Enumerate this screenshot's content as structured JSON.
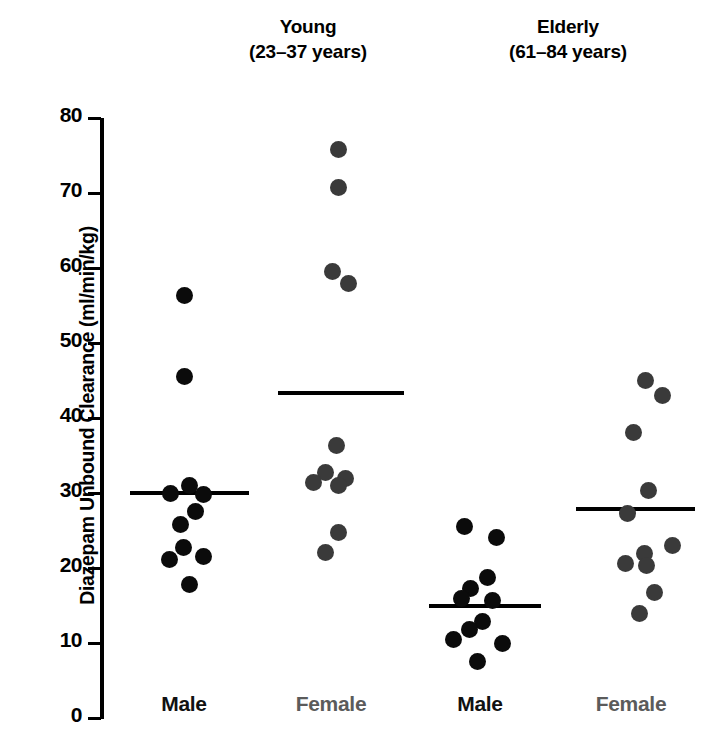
{
  "figure": {
    "width": 713,
    "height": 742,
    "background": "#ffffff"
  },
  "headers": [
    {
      "name": "Young",
      "range": "(23–37 years)"
    },
    {
      "name": "Elderly",
      "range": "(61–84 years)"
    }
  ],
  "axis": {
    "title": "Diazepam Unbound Clearance (ml/min/kg)",
    "ticks": [
      "80",
      "70",
      "60",
      "50",
      "40",
      "30",
      "20",
      "10",
      "0"
    ]
  },
  "x_labels": [
    {
      "text": "Male",
      "color": "#111111"
    },
    {
      "text": "Female",
      "color": "#5b5b5b"
    },
    {
      "text": "Male",
      "color": "#111111"
    },
    {
      "text": "Female",
      "color": "#5b5b5b"
    }
  ],
  "colors": {
    "male_dot": "#0b0b0b",
    "female_dot": "#3a3a3a",
    "axis": "#000000",
    "mean_line": "#000000",
    "background": "#ffffff"
  },
  "chart_data": {
    "type": "scatter",
    "xlabel": "",
    "ylabel": "Diazepam Unbound Clearance (ml/min/kg)",
    "ylim": [
      0,
      80
    ],
    "ytick_step": 10,
    "yticks": [
      0,
      10,
      20,
      30,
      40,
      50,
      60,
      70,
      80
    ],
    "grid": false,
    "legend": "none",
    "groups": [
      {
        "group": "Young",
        "age_range": "23-37 years",
        "sex": "Male",
        "color": "#0b0b0b",
        "mean": 30.0,
        "n": 12,
        "values": [
          56.4,
          45.6,
          31.0,
          30.2,
          29.8,
          27.8,
          26.1,
          24.4,
          23.0,
          21.5,
          20.6,
          17.8
        ]
      },
      {
        "group": "Young",
        "age_range": "23-37 years",
        "sex": "Female",
        "color": "#3a3a3a",
        "mean": 43.3,
        "n": 9,
        "values": [
          75.8,
          70.8,
          59.6,
          58.0,
          36.4,
          32.8,
          32.0,
          31.3,
          31.0,
          24.8,
          22.1
        ]
      },
      {
        "group": "Elderly",
        "age_range": "61-84 years",
        "sex": "Male",
        "color": "#0b0b0b",
        "mean": 15.0,
        "n": 11,
        "values": [
          25.5,
          24.1,
          18.8,
          17.3,
          16.4,
          15.8,
          13.0,
          11.9,
          11.0,
          9.9,
          7.6
        ]
      },
      {
        "group": "Elderly",
        "age_range": "61-84 years",
        "sex": "Female",
        "color": "#3a3a3a",
        "mean": 27.9,
        "n": 11,
        "values": [
          45.0,
          43.0,
          38.1,
          30.4,
          27.3,
          23.0,
          20.8,
          20.4,
          21.8,
          16.8,
          14.0
        ]
      }
    ],
    "points": [
      {
        "col": 0,
        "sex": "Male",
        "x": 184,
        "y": 56.4
      },
      {
        "col": 0,
        "sex": "Male",
        "x": 184,
        "y": 45.6
      },
      {
        "col": 0,
        "sex": "Male",
        "x": 189,
        "y": 31.0
      },
      {
        "col": 0,
        "sex": "Male",
        "x": 170,
        "y": 29.9
      },
      {
        "col": 0,
        "sex": "Male",
        "x": 203,
        "y": 29.8
      },
      {
        "col": 0,
        "sex": "Male",
        "x": 195,
        "y": 27.5
      },
      {
        "col": 0,
        "sex": "Male",
        "x": 180,
        "y": 25.8
      },
      {
        "col": 0,
        "sex": "Male",
        "x": 183,
        "y": 22.8
      },
      {
        "col": 0,
        "sex": "Male",
        "x": 203,
        "y": 21.6
      },
      {
        "col": 0,
        "sex": "Male",
        "x": 169,
        "y": 21.2
      },
      {
        "col": 0,
        "sex": "Male",
        "x": 189,
        "y": 17.8
      },
      {
        "col": 1,
        "sex": "Female",
        "x": 338,
        "y": 75.8
      },
      {
        "col": 1,
        "sex": "Female",
        "x": 338,
        "y": 70.8
      },
      {
        "col": 1,
        "sex": "Female",
        "x": 332,
        "y": 59.6
      },
      {
        "col": 1,
        "sex": "Female",
        "x": 348,
        "y": 58.0
      },
      {
        "col": 1,
        "sex": "Female",
        "x": 336,
        "y": 36.4
      },
      {
        "col": 1,
        "sex": "Female",
        "x": 325,
        "y": 32.7
      },
      {
        "col": 1,
        "sex": "Female",
        "x": 313,
        "y": 31.4
      },
      {
        "col": 1,
        "sex": "Female",
        "x": 345,
        "y": 32.0
      },
      {
        "col": 1,
        "sex": "Female",
        "x": 338,
        "y": 31.0
      },
      {
        "col": 1,
        "sex": "Female",
        "x": 338,
        "y": 24.8
      },
      {
        "col": 1,
        "sex": "Female",
        "x": 325,
        "y": 22.1
      },
      {
        "col": 2,
        "sex": "Male",
        "x": 464,
        "y": 25.5
      },
      {
        "col": 2,
        "sex": "Male",
        "x": 496,
        "y": 24.1
      },
      {
        "col": 2,
        "sex": "Male",
        "x": 487,
        "y": 18.8
      },
      {
        "col": 2,
        "sex": "Male",
        "x": 470,
        "y": 17.3
      },
      {
        "col": 2,
        "sex": "Male",
        "x": 461,
        "y": 16.0
      },
      {
        "col": 2,
        "sex": "Male",
        "x": 492,
        "y": 15.7
      },
      {
        "col": 2,
        "sex": "Male",
        "x": 482,
        "y": 12.9
      },
      {
        "col": 2,
        "sex": "Male",
        "x": 469,
        "y": 11.8
      },
      {
        "col": 2,
        "sex": "Male",
        "x": 453,
        "y": 10.5
      },
      {
        "col": 2,
        "sex": "Male",
        "x": 502,
        "y": 10.0
      },
      {
        "col": 2,
        "sex": "Male",
        "x": 477,
        "y": 7.6
      },
      {
        "col": 3,
        "sex": "Female",
        "x": 645,
        "y": 45.0
      },
      {
        "col": 3,
        "sex": "Female",
        "x": 662,
        "y": 43.0
      },
      {
        "col": 3,
        "sex": "Female",
        "x": 633,
        "y": 38.1
      },
      {
        "col": 3,
        "sex": "Female",
        "x": 648,
        "y": 30.4
      },
      {
        "col": 3,
        "sex": "Female",
        "x": 627,
        "y": 27.3
      },
      {
        "col": 3,
        "sex": "Female",
        "x": 644,
        "y": 22.0
      },
      {
        "col": 3,
        "sex": "Female",
        "x": 672,
        "y": 23.0
      },
      {
        "col": 3,
        "sex": "Female",
        "x": 625,
        "y": 20.6
      },
      {
        "col": 3,
        "sex": "Female",
        "x": 646,
        "y": 20.4
      },
      {
        "col": 3,
        "sex": "Female",
        "x": 654,
        "y": 16.8
      },
      {
        "col": 3,
        "sex": "Female",
        "x": 639,
        "y": 14.0
      }
    ],
    "mean_lines": [
      {
        "col": 0,
        "value": 30.0,
        "x_start": 130,
        "x_end": 249
      },
      {
        "col": 1,
        "value": 43.3,
        "x_start": 278,
        "x_end": 404
      },
      {
        "col": 2,
        "value": 15.0,
        "x_start": 429,
        "x_end": 541
      },
      {
        "col": 3,
        "value": 27.9,
        "x_start": 576,
        "x_end": 695
      }
    ],
    "column_centers": [
      184,
      338,
      480,
      645
    ]
  }
}
